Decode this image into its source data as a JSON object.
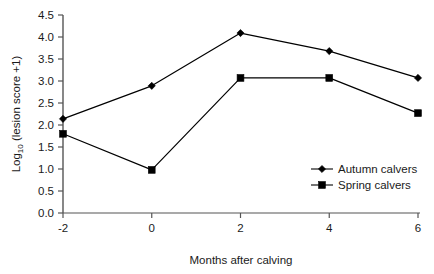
{
  "chart_data": {
    "type": "line",
    "title": "",
    "xlabel": "Months after calving",
    "ylabel_prefix": "Log",
    "ylabel_subscript": "10",
    "ylabel_suffix": " (lesion score +1)",
    "ylabel": "Log10 (lesion score +1)",
    "x": [
      -2,
      0,
      2,
      4,
      6
    ],
    "xtick_labels": [
      "-2",
      "0",
      "2",
      "4",
      "6"
    ],
    "ytick_labels": [
      "0.0",
      "0.5",
      "1.0",
      "1.5",
      "2.0",
      "2.5",
      "3.0",
      "3.5",
      "4.0",
      "4.5"
    ],
    "ytick_values": [
      0.0,
      0.5,
      1.0,
      1.5,
      2.0,
      2.5,
      3.0,
      3.5,
      4.0,
      4.5
    ],
    "xlim": [
      -2,
      6
    ],
    "ylim": [
      0.0,
      4.5
    ],
    "grid": false,
    "legend_position": "inside-right-lower",
    "series": [
      {
        "name": "Autumn calvers",
        "marker": "diamond",
        "color": "#000000",
        "values": [
          2.14,
          2.89,
          4.09,
          3.68,
          3.07
        ]
      },
      {
        "name": "Spring calvers",
        "marker": "square",
        "color": "#000000",
        "values": [
          1.8,
          0.98,
          3.07,
          3.07,
          2.27
        ]
      }
    ]
  },
  "legend": {
    "items": [
      {
        "label": "Autumn calvers",
        "marker": "diamond"
      },
      {
        "label": "Spring calvers",
        "marker": "square"
      }
    ]
  },
  "axes": {
    "x_title": "Months after calving",
    "y_title_main": "Log",
    "y_title_sub": "10",
    "y_title_rest": " (lesion score +1)"
  },
  "colors": {
    "axis": "#555555",
    "line": "#1a1a1a",
    "marker": "#000000",
    "text": "#1a1a1a",
    "background": "#ffffff"
  }
}
